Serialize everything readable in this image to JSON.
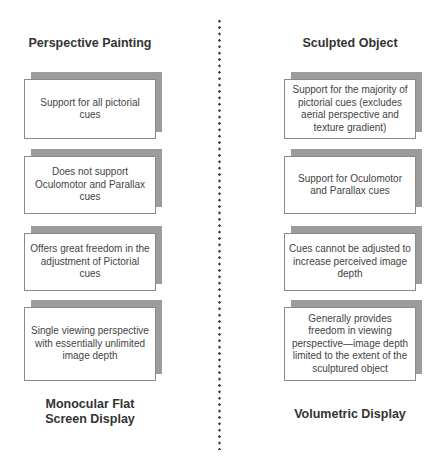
{
  "left_column": {
    "top_title": "Perspective Painting",
    "bottom_title_line1": "Monocular Flat",
    "bottom_title_line2": "Screen Display",
    "cards": [
      {
        "text": "Support for all pictorial cues"
      },
      {
        "text": "Does not support Oculomotor and Parallax cues"
      },
      {
        "text": "Offers great freedom in the adjustment of Pictorial cues"
      },
      {
        "text": "Single viewing perspective with essentially unlimited image depth"
      }
    ]
  },
  "right_column": {
    "top_title": "Sculpted Object",
    "bottom_title": "Volumetric Display",
    "cards": [
      {
        "text": "Support for the majority of pictorial cues (excludes aerial perspective and texture gradient)"
      },
      {
        "text": "Support for Oculomotor and Parallax cues"
      },
      {
        "text": "Cues cannot be adjusted to increase perceived image depth"
      },
      {
        "text": "Generally provides freedom in viewing perspective—image depth limited to the extent of the sculptured object"
      }
    ]
  },
  "colors": {
    "shadow": "#9c9c9c",
    "border": "#8a8a8a",
    "title_text": "#333333",
    "body_text": "#444444",
    "divider": "#333333"
  }
}
